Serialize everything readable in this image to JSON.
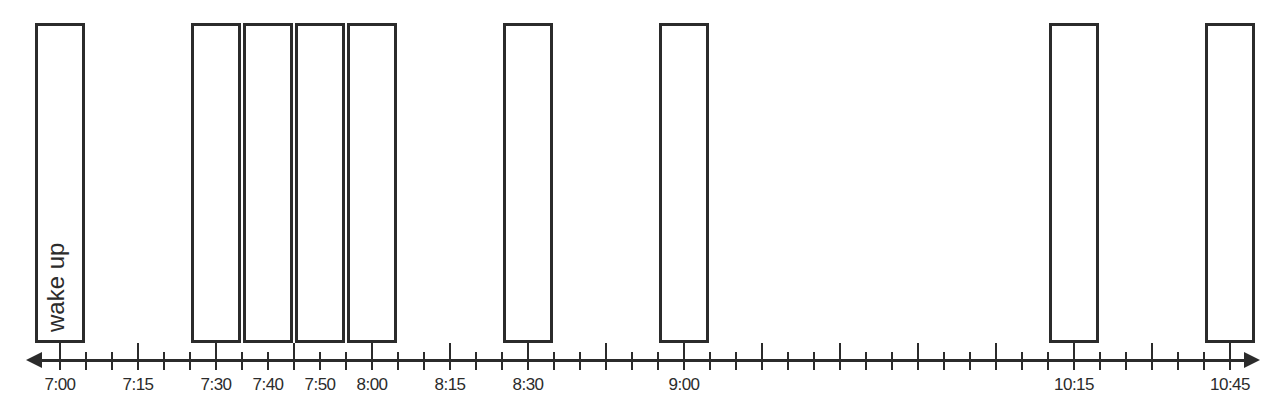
{
  "diagram": {
    "type": "timeline",
    "axis": {
      "start_minute": 0,
      "origin_label": "7:00",
      "tick_interval_minutes": 5,
      "direction": "bidirectional-arrow",
      "labels": [
        {
          "text": "7:00",
          "minute": 0
        },
        {
          "text": "7:15",
          "minute": 15
        },
        {
          "text": "7:30",
          "minute": 30
        },
        {
          "text": "7:40",
          "minute": 40
        },
        {
          "text": "7:50",
          "minute": 50
        },
        {
          "text": "8:00",
          "minute": 60
        },
        {
          "text": "8:15",
          "minute": 75
        },
        {
          "text": "8:30",
          "minute": 90
        },
        {
          "text": "9:00",
          "minute": 120
        },
        {
          "text": "10:15",
          "minute": 195
        },
        {
          "text": "10:45",
          "minute": 225
        }
      ],
      "major_ticks_minutes": [
        15,
        30,
        45,
        60,
        75,
        90,
        105,
        120,
        135,
        150,
        165,
        180,
        195,
        210,
        225
      ],
      "minor_tick_count": 46
    },
    "events": [
      {
        "time": "7:00",
        "minute": 0,
        "label": "wake up"
      },
      {
        "time": "7:30",
        "minute": 30,
        "label": ""
      },
      {
        "time": "7:40",
        "minute": 40,
        "label": ""
      },
      {
        "time": "7:50",
        "minute": 50,
        "label": ""
      },
      {
        "time": "8:00",
        "minute": 60,
        "label": ""
      },
      {
        "time": "8:30",
        "minute": 90,
        "label": ""
      },
      {
        "time": "9:00",
        "minute": 120,
        "label": ""
      },
      {
        "time": "10:15",
        "minute": 195,
        "label": ""
      },
      {
        "time": "10:45",
        "minute": 225,
        "label": ""
      }
    ],
    "colors": {
      "stroke": "#2b2b2b",
      "background": "#ffffff"
    }
  }
}
